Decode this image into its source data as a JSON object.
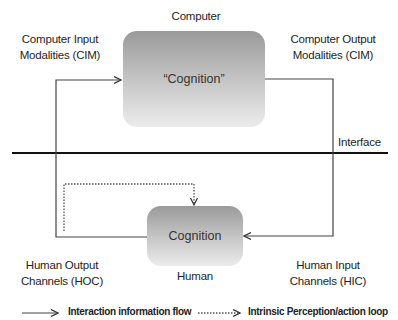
{
  "diagram": {
    "top_label": "Computer",
    "top_box_text": "“Cognition”",
    "cim_input": [
      "Computer Input",
      "Modalities (CIM)"
    ],
    "cim_output": [
      "Computer Output",
      "Modalities (CIM)"
    ],
    "interface_label": "Interface",
    "bottom_box_text": "Cognition",
    "bottom_label": "Human",
    "hoc": [
      "Human Output",
      "Channels (HOC)"
    ],
    "hic": [
      "Human Input",
      "Channels (HIC)"
    ]
  },
  "legend": {
    "solid_label": "Interaction information flow",
    "dotted_label": "Intrinsic Perception/action loop"
  },
  "colors": {
    "line": "#333333",
    "box_top": "#9a9a9a",
    "box_bottom": "#ececec"
  }
}
